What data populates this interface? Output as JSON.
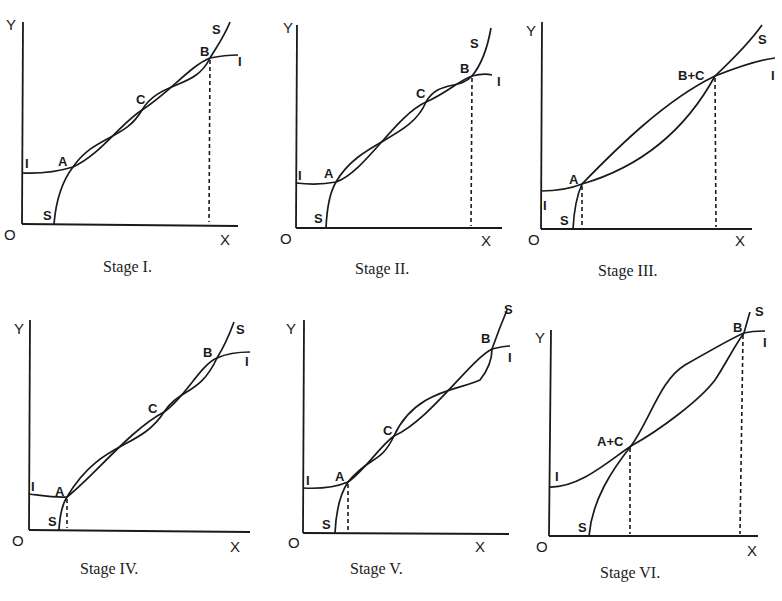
{
  "figure": {
    "panels": [
      {
        "id": "stage-1",
        "caption": "Stage I.",
        "axis_labels": {
          "y": "Y",
          "x": "X",
          "origin": "O"
        },
        "curve_labels": {
          "i_left": "I",
          "i_right": "I",
          "s_bottom": "S",
          "s_top": "S"
        },
        "points": [
          {
            "label": "A"
          },
          {
            "label": "C"
          },
          {
            "label": "B"
          }
        ],
        "dashed_at": [
          "B"
        ]
      },
      {
        "id": "stage-2",
        "caption": "Stage II.",
        "axis_labels": {
          "y": "Y",
          "x": "X",
          "origin": "O"
        },
        "curve_labels": {
          "i_left": "I",
          "i_right": "I",
          "s_bottom": "S",
          "s_top": "S"
        },
        "points": [
          {
            "label": "A"
          },
          {
            "label": "C"
          },
          {
            "label": "B"
          }
        ],
        "dashed_at": [
          "B"
        ]
      },
      {
        "id": "stage-3",
        "caption": "Stage III.",
        "axis_labels": {
          "y": "Y",
          "x": "X",
          "origin": "O"
        },
        "curve_labels": {
          "i_left": "I",
          "i_right": "I",
          "s_bottom": "S",
          "s_top": "S"
        },
        "points": [
          {
            "label": "A"
          },
          {
            "label": "B+C"
          }
        ],
        "dashed_at": [
          "A",
          "B+C"
        ]
      },
      {
        "id": "stage-4",
        "caption": "Stage IV.",
        "axis_labels": {
          "y": "Y",
          "x": "X",
          "origin": "O"
        },
        "curve_labels": {
          "i_left": "I",
          "i_right": "I",
          "s_bottom": "S",
          "s_top": "S"
        },
        "points": [
          {
            "label": "A"
          },
          {
            "label": "C"
          },
          {
            "label": "B"
          }
        ],
        "dashed_at": [
          "A"
        ]
      },
      {
        "id": "stage-5",
        "caption": "Stage V.",
        "axis_labels": {
          "y": "Y",
          "x": "X",
          "origin": "O"
        },
        "curve_labels": {
          "i_left": "I",
          "i_right": "I",
          "s_bottom": "S",
          "s_top": "S"
        },
        "points": [
          {
            "label": "A"
          },
          {
            "label": "C"
          },
          {
            "label": "B"
          }
        ],
        "dashed_at": [
          "A"
        ]
      },
      {
        "id": "stage-6",
        "caption": "Stage VI.",
        "axis_labels": {
          "y": "Y",
          "x": "X",
          "origin": "O"
        },
        "curve_labels": {
          "i_left": "I",
          "i_right": "I",
          "s_bottom": "S",
          "s_top": "S"
        },
        "points": [
          {
            "label": "A+C"
          },
          {
            "label": "B"
          }
        ],
        "dashed_at": [
          "A+C",
          "B"
        ]
      }
    ]
  }
}
